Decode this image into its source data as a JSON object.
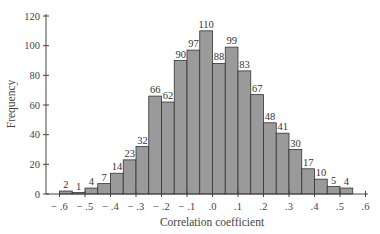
{
  "chart_data": {
    "type": "bar",
    "title": "",
    "xlabel": "Correlation coefficient",
    "ylabel": "Frequency",
    "ylim": [
      0,
      120
    ],
    "xlim": [
      -0.6,
      0.6
    ],
    "yticks": [
      0,
      20,
      40,
      60,
      80,
      100,
      120
    ],
    "xticks": [
      "-.6",
      "-.5",
      "-.4",
      "-.3",
      "-.2",
      "-.1",
      ".0",
      ".1",
      ".2",
      ".3",
      ".4",
      ".5",
      ".6"
    ],
    "bin_width": 0.05,
    "bin_edges_start": [
      -0.6,
      -0.55,
      -0.5,
      -0.45,
      -0.4,
      -0.35,
      -0.3,
      -0.25,
      -0.2,
      -0.15,
      -0.1,
      -0.05,
      0.0,
      0.05,
      0.1,
      0.15,
      0.2,
      0.25,
      0.3,
      0.35,
      0.4,
      0.45,
      0.5
    ],
    "values": [
      2,
      1,
      4,
      7,
      14,
      23,
      32,
      66,
      62,
      90,
      97,
      110,
      88,
      99,
      83,
      67,
      48,
      41,
      30,
      17,
      10,
      5,
      4
    ],
    "grid": false,
    "legend": null,
    "bar_color": "#9a9a9a",
    "bar_edge_color": "#333333"
  }
}
